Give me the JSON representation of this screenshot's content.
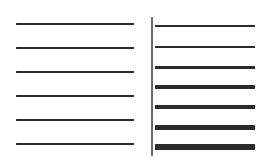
{
  "diagram": {
    "colors": {
      "background": "#ffffff",
      "line": "#2b2b2b",
      "divider": "#6a6a6a"
    },
    "left_panel": {
      "x_start": 16,
      "x_end": 134,
      "lines": [
        {
          "y": 23,
          "thickness": 2
        },
        {
          "y": 47,
          "thickness": 2
        },
        {
          "y": 71,
          "thickness": 2
        },
        {
          "y": 95,
          "thickness": 2
        },
        {
          "y": 119,
          "thickness": 2
        },
        {
          "y": 143,
          "thickness": 2
        }
      ]
    },
    "divider": {
      "x": 151,
      "y_start": 17,
      "y_end": 156,
      "thickness": 1.5
    },
    "right_panel": {
      "x_start": 155,
      "x_end": 255,
      "lines": [
        {
          "y": 25,
          "thickness": 1.2
        },
        {
          "y": 46,
          "thickness": 1.2
        },
        {
          "y": 66,
          "thickness": 3
        },
        {
          "y": 86,
          "thickness": 3.5
        },
        {
          "y": 106,
          "thickness": 4
        },
        {
          "y": 126,
          "thickness": 5
        },
        {
          "y": 146,
          "thickness": 5.5
        }
      ]
    }
  }
}
